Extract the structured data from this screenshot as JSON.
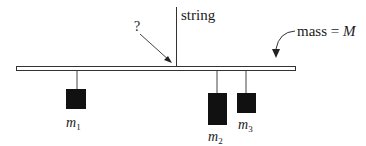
{
  "diagram": {
    "string_label": "string",
    "unknown_label": "?",
    "beam_mass_label_prefix": "mass = ",
    "beam_mass_symbol": "M",
    "masses": [
      {
        "symbol": "m",
        "subscript": "1"
      },
      {
        "symbol": "m",
        "subscript": "2"
      },
      {
        "symbol": "m",
        "subscript": "3"
      }
    ],
    "colors": {
      "line": "#333333",
      "mass_fill": "#111111",
      "beam_fill": "#ffffff"
    }
  }
}
